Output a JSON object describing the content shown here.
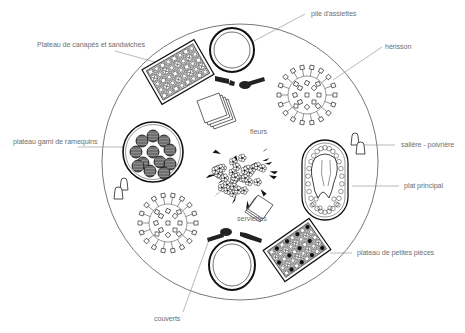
{
  "diagram": {
    "colors": {
      "line": "#222222",
      "leader": "#8a8a8a",
      "label": "#707070",
      "background": "#ffffff"
    },
    "labels": {
      "plates_stack": "pile d'assiettes",
      "canapes_tray": "Plateau de canapés et sandwiches",
      "hedgehog": "hérisson",
      "ramekin_tray": "plateau garni de ramequins",
      "salt_pepper": "salière - poivrière",
      "flowers": "fleurs",
      "main_dish": "plat principal",
      "napkins": "serviettes",
      "small_bites_tray": "plateau de petites pièces",
      "cutlery": "couverts"
    },
    "items": [
      {
        "id": "table",
        "shape": "circle"
      },
      {
        "id": "plates_stack",
        "count": 2
      },
      {
        "id": "canapes_tray",
        "count": 1
      },
      {
        "id": "hedgehog",
        "count": 2
      },
      {
        "id": "ramekin_tray",
        "ramekins": 12
      },
      {
        "id": "salt_pepper",
        "count": 2
      },
      {
        "id": "flowers",
        "count": 1
      },
      {
        "id": "main_dish",
        "count": 1
      },
      {
        "id": "napkins",
        "count": 2
      },
      {
        "id": "small_bites_tray",
        "count": 1
      },
      {
        "id": "cutlery",
        "count": 2
      }
    ]
  }
}
